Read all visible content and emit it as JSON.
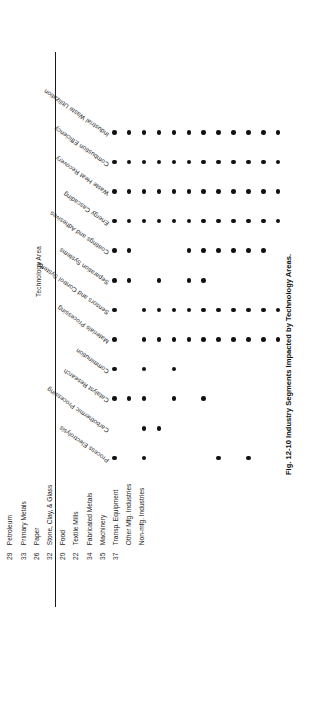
{
  "figure": {
    "caption": "Fig. 12-10  Industry Segments Impacted by Technology Areas.",
    "axis_title": "Technology Area"
  },
  "legend": {
    "header_sic": "SIC",
    "header_group": "Industry Group",
    "rows": [
      {
        "sic": "28",
        "name": "Chemicals"
      },
      {
        "sic": "29",
        "name": "Petroleum"
      },
      {
        "sic": "33",
        "name": "Primary Metals"
      },
      {
        "sic": "26",
        "name": "Paper"
      },
      {
        "sic": "32",
        "name": "Stone, Clay, & Glass"
      },
      {
        "sic": "20",
        "name": "Food"
      },
      {
        "sic": "22",
        "name": "Textile Mills"
      },
      {
        "sic": "34",
        "name": "Fabricated Metals"
      },
      {
        "sic": "35",
        "name": "Machinery"
      },
      {
        "sic": "37",
        "name": "Transp. Equipment"
      },
      {
        "sic": "",
        "name": "Other Mfg. Industries"
      },
      {
        "sic": "",
        "name": "Non-mfg. Industries"
      }
    ]
  },
  "chart_data": {
    "type": "heatmap",
    "title": "Fig. 12-10  Industry Segments Impacted by Technology Areas.",
    "xlabel": "Industry Group",
    "ylabel": "Technology Area",
    "grid": false,
    "legend_position": "bottom",
    "marker": "filled-dot",
    "categories": [
      "Chemicals",
      "Petroleum",
      "Primary Metals",
      "Paper",
      "Stone, Clay, & Glass",
      "Food",
      "Textile Mills",
      "Fabricated Metals",
      "Machinery",
      "Transp. Equipment",
      "Other Mfg. Industries",
      "Non-mfg. Industries"
    ],
    "rows": [
      {
        "name": "Industrial Waste Utilization",
        "values": [
          1,
          1,
          1,
          1,
          1,
          1,
          1,
          1,
          1,
          1,
          1,
          1
        ]
      },
      {
        "name": "Combustion Efficiency",
        "values": [
          1,
          1,
          1,
          1,
          1,
          1,
          1,
          1,
          1,
          1,
          1,
          1
        ]
      },
      {
        "name": "Waste Heat Recovery",
        "values": [
          1,
          1,
          1,
          1,
          1,
          1,
          1,
          1,
          1,
          1,
          1,
          1
        ]
      },
      {
        "name": "Energy Cascading",
        "values": [
          1,
          1,
          1,
          1,
          1,
          1,
          1,
          1,
          1,
          1,
          1,
          1
        ]
      },
      {
        "name": "Coatings and Adhesives",
        "values": [
          1,
          1,
          0,
          0,
          0,
          1,
          1,
          1,
          1,
          1,
          1,
          0
        ]
      },
      {
        "name": "Separation Systems",
        "values": [
          1,
          1,
          0,
          1,
          0,
          1,
          1,
          0,
          0,
          0,
          0,
          0
        ]
      },
      {
        "name": "Sensors and Control Systems",
        "values": [
          1,
          0,
          1,
          1,
          1,
          1,
          1,
          1,
          1,
          1,
          1,
          1
        ]
      },
      {
        "name": "Materials Processing",
        "values": [
          1,
          0,
          1,
          1,
          1,
          1,
          1,
          1,
          1,
          1,
          1,
          1
        ]
      },
      {
        "name": "Comminution",
        "values": [
          1,
          0,
          1,
          0,
          1,
          0,
          0,
          0,
          0,
          0,
          0,
          0
        ]
      },
      {
        "name": "Catalyst Research",
        "values": [
          1,
          1,
          1,
          0,
          1,
          0,
          1,
          0,
          0,
          0,
          0,
          0
        ]
      },
      {
        "name": "Carbothermic Processing",
        "values": [
          0,
          0,
          1,
          1,
          0,
          0,
          0,
          0,
          0,
          0,
          0,
          0
        ]
      },
      {
        "name": "Process Electrolysis",
        "values": [
          1,
          0,
          1,
          0,
          0,
          0,
          0,
          1,
          0,
          1,
          0,
          0
        ]
      }
    ]
  }
}
